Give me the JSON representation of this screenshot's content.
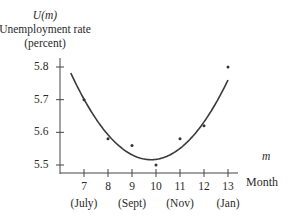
{
  "chart_data": {
    "type": "scatter",
    "title": "",
    "ylabel_lines": [
      "U(m)",
      "Unemployment rate",
      "(percent)"
    ],
    "xlabel_lines": [
      "m",
      "Month"
    ],
    "x": [
      7,
      8,
      9,
      10,
      11,
      12,
      13
    ],
    "x_tick_labels": [
      "7",
      "8",
      "9",
      "10",
      "11",
      "12",
      "13"
    ],
    "x_sub_labels": [
      {
        "at": 7,
        "label": "(July)"
      },
      {
        "at": 9,
        "label": "(Sept)"
      },
      {
        "at": 11,
        "label": "(Nov)"
      },
      {
        "at": 13,
        "label": "(Jan)"
      }
    ],
    "y_ticks": [
      5.5,
      5.6,
      5.7,
      5.8
    ],
    "y_tick_labels": [
      "5.5",
      "5.6",
      "5.7",
      "5.8"
    ],
    "ylim": [
      5.48,
      5.82
    ],
    "xlim": [
      6,
      13.6
    ],
    "series": [
      {
        "name": "Observed",
        "type": "scatter",
        "x": [
          7,
          8,
          9,
          10,
          11,
          12,
          13
        ],
        "values": [
          5.7,
          5.58,
          5.56,
          5.5,
          5.58,
          5.62,
          5.8
        ]
      },
      {
        "name": "Quadratic fit U(m)",
        "type": "line",
        "x": [
          6.4,
          7,
          8,
          9,
          10,
          11,
          12,
          13
        ],
        "values": [
          5.78,
          5.7,
          5.605,
          5.545,
          5.52,
          5.535,
          5.61,
          5.78
        ]
      }
    ],
    "grid": false,
    "legend": null
  }
}
